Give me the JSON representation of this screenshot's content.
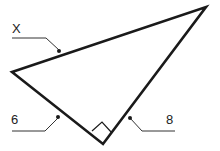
{
  "diagram": {
    "type": "right-triangle",
    "colors": {
      "stroke": "#1a1a1a",
      "label": "#222222",
      "background": "#ffffff"
    },
    "vertices": {
      "left": [
        12,
        72
      ],
      "top": [
        206,
        7
      ],
      "right_angle": [
        103,
        144
      ]
    },
    "labels": {
      "hypotenuse": "X",
      "left_leg": "6",
      "right_leg": "8"
    },
    "right_angle_marker": true
  }
}
